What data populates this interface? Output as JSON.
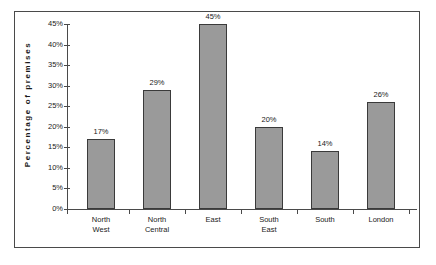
{
  "chart_data": {
    "type": "bar",
    "title": "",
    "xlabel": "",
    "ylabel": "Percentage  of  premises",
    "categories": [
      "North West",
      "North Central",
      "East",
      "South East",
      "South",
      "London"
    ],
    "categories_lines": [
      [
        "North",
        "West"
      ],
      [
        "North",
        "Central"
      ],
      [
        "East",
        ""
      ],
      [
        "South",
        "East"
      ],
      [
        "South",
        ""
      ],
      [
        "London",
        ""
      ]
    ],
    "values": [
      17,
      29,
      45,
      20,
      14,
      26
    ],
    "value_labels": [
      "17%",
      "29%",
      "45%",
      "20%",
      "14%",
      "26%"
    ],
    "ylim": [
      0,
      45
    ],
    "ytick_values": [
      0,
      5,
      10,
      15,
      20,
      25,
      30,
      35,
      40,
      45
    ],
    "ytick_labels": [
      "0%",
      "5%",
      "10%",
      "15%",
      "20%",
      "25%",
      "30%",
      "35%",
      "40%",
      "45%"
    ],
    "grid": false,
    "legend": "none",
    "bar_fill_color": "#9a9a9a",
    "bar_border_color": "#3a3a3a",
    "axis_color": "#4a4a4a",
    "frame_color": "#4a4a4a",
    "text_color": "#1a1a1a",
    "background_color": "#ffffff"
  }
}
